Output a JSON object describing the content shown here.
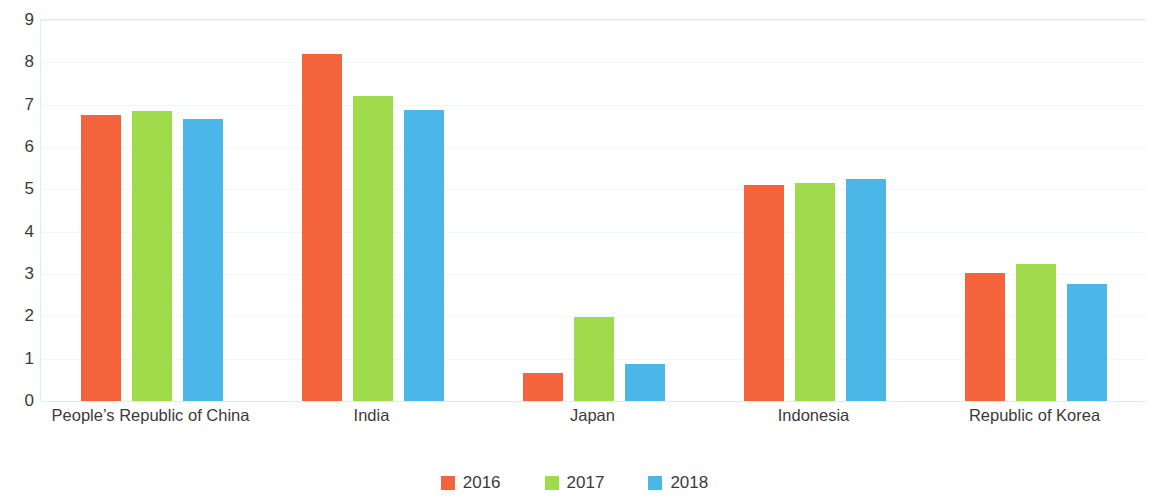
{
  "chart_data": {
    "type": "bar",
    "title": "",
    "subtitle": "",
    "xlabel": "",
    "ylabel": "",
    "ylim": [
      0,
      9
    ],
    "ytick_step": 1,
    "yticks": [
      "9",
      "8",
      "7",
      "6",
      "5",
      "4",
      "3",
      "2",
      "1",
      "0"
    ],
    "grid": true,
    "grid_axis": "y",
    "legend_position": "bottom-center",
    "categories": [
      "People’s Republic of China",
      "India",
      "Japan",
      "Indonesia",
      "Republic of Korea"
    ],
    "series": [
      {
        "name": "2016",
        "color": "#f4643c",
        "values": [
          6.75,
          8.2,
          0.65,
          5.1,
          3.03
        ]
      },
      {
        "name": "2017",
        "color": "#a0db4b",
        "values": [
          6.85,
          7.2,
          1.98,
          5.15,
          3.24
        ]
      },
      {
        "name": "2018",
        "color": "#4bb7e8",
        "values": [
          6.65,
          6.88,
          0.87,
          5.25,
          2.76
        ]
      }
    ]
  },
  "legend": {
    "items": [
      {
        "label": "2016",
        "color": "#f4643c",
        "icon": "square-swatch-icon"
      },
      {
        "label": "2017",
        "color": "#a0db4b",
        "icon": "square-swatch-icon"
      },
      {
        "label": "2018",
        "color": "#4bb7e8",
        "icon": "square-swatch-icon"
      }
    ]
  },
  "colors": {
    "gridline": "#eef7fa",
    "axis": "#d9eef5",
    "text": "#3b3b3b",
    "background": "#ffffff"
  }
}
